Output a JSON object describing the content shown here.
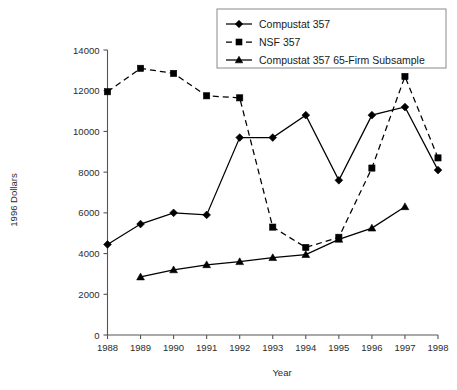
{
  "chart_data": {
    "type": "line",
    "title": "",
    "xlabel": "Year",
    "ylabel": "1996 Dollars",
    "categories": [
      1988,
      1989,
      1990,
      1991,
      1992,
      1993,
      1994,
      1995,
      1996,
      1997,
      1998
    ],
    "x_tick_labels": [
      "1988",
      "1989",
      "1990",
      "1991",
      "1992",
      "1993",
      "1994",
      "1995",
      "1996",
      "1997",
      "1998"
    ],
    "y_tick_labels": [
      "0",
      "2000",
      "4000",
      "6000",
      "8000",
      "10000",
      "12000",
      "14000"
    ],
    "y_ticks": [
      0,
      2000,
      4000,
      6000,
      8000,
      10000,
      12000,
      14000
    ],
    "ylim": [
      0,
      14000
    ],
    "xlim": [
      1988,
      1998
    ],
    "grid": false,
    "legend_position": "top-right",
    "series": [
      {
        "name": "Compustat 357",
        "marker": "diamond",
        "line_style": "solid",
        "color": "#000000",
        "x": [
          1988,
          1989,
          1990,
          1991,
          1992,
          1993,
          1994,
          1995,
          1996,
          1997,
          1998
        ],
        "values": [
          4450,
          5450,
          6000,
          5900,
          9700,
          9700,
          10800,
          7600,
          10800,
          11200,
          8100
        ]
      },
      {
        "name": "NSF 357",
        "marker": "square",
        "line_style": "dashed",
        "color": "#000000",
        "x": [
          1988,
          1989,
          1990,
          1991,
          1992,
          1993,
          1994,
          1995,
          1996,
          1997,
          1998
        ],
        "values": [
          11950,
          13100,
          12850,
          11750,
          11650,
          5300,
          4300,
          4800,
          8200,
          12700,
          8700
        ]
      },
      {
        "name": "Compustat 357 65-Firm Subsample",
        "marker": "triangle",
        "line_style": "solid",
        "color": "#000000",
        "x": [
          1989,
          1990,
          1991,
          1992,
          1993,
          1994,
          1995,
          1996,
          1997
        ],
        "values": [
          2850,
          3200,
          3450,
          3600,
          3800,
          3950,
          4700,
          5250,
          6300
        ]
      }
    ]
  },
  "legend": {
    "entries": [
      {
        "label": "Compustat 357",
        "marker": "diamond",
        "line_style": "solid"
      },
      {
        "label": "NSF 357",
        "marker": "square",
        "line_style": "dashed"
      },
      {
        "label": "Compustat 357 65-Firm Subsample",
        "marker": "triangle",
        "line_style": "solid"
      }
    ]
  }
}
